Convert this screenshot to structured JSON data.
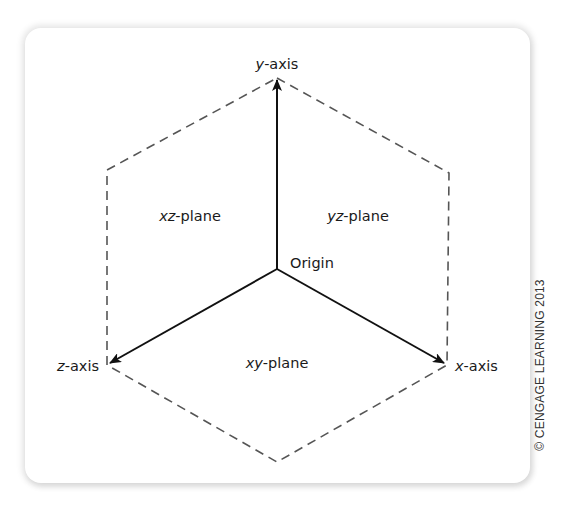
{
  "figure": {
    "colors": {
      "axis": "#111111",
      "dashed_edges": "#555555",
      "text": "#1a1a1a",
      "card_background": "#ffffff"
    },
    "axes": {
      "y": {
        "prefix": "y",
        "suffix": "-axis"
      },
      "x": {
        "prefix": "x",
        "suffix": "-axis"
      },
      "z": {
        "prefix": "z",
        "suffix": "-axis"
      }
    },
    "planes": {
      "xz": {
        "prefix": "xz",
        "suffix": "-plane"
      },
      "yz": {
        "prefix": "yz",
        "suffix": "-plane"
      },
      "xy": {
        "prefix": "xy",
        "suffix": "-plane"
      }
    },
    "origin_label": "Origin",
    "copyright": "© CENGAGE LEARNING 2013"
  }
}
